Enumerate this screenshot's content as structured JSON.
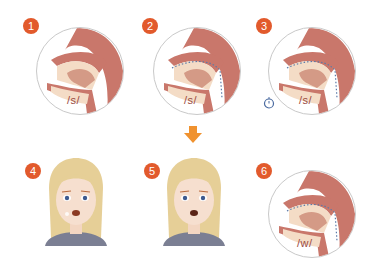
{
  "steps": [
    {
      "number": "1",
      "phoneme": "/s/",
      "type": "sagittal"
    },
    {
      "number": "2",
      "phoneme": "/s/",
      "type": "sagittal"
    },
    {
      "number": "3",
      "phoneme": "/s/",
      "type": "sagittal"
    },
    {
      "number": "4",
      "phoneme": "",
      "type": "face"
    },
    {
      "number": "5",
      "phoneme": "",
      "type": "face"
    },
    {
      "number": "6",
      "phoneme": "/w/",
      "type": "sagittal"
    }
  ],
  "colors": {
    "badge": "#e25a2c",
    "arrow": "#f0922f",
    "tissue": "#c9776b",
    "flesh": "#f4dcc6",
    "hair": "#e6cf97",
    "shirt": "#7b7f93"
  }
}
